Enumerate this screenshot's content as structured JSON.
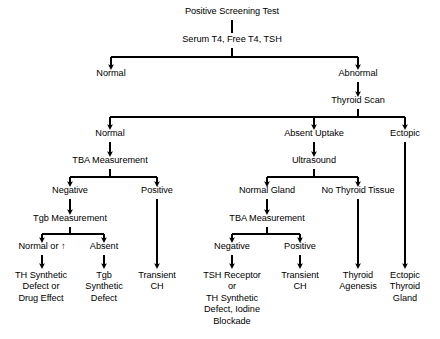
{
  "diagram": {
    "title": "Positive Screening Test",
    "style": {
      "stroke": "#000000",
      "text_color": "#000000",
      "background": "#ffffff"
    },
    "nodes": [
      {
        "id": "positive-screening-test",
        "label": "Positive Screening Test",
        "x": 232,
        "y": 12
      },
      {
        "id": "serum-t4-free-t4-tsh",
        "label": "Serum T4, Free T4, TSH",
        "x": 232,
        "y": 41
      },
      {
        "id": "normal-labs",
        "label": "Normal",
        "x": 111,
        "y": 74
      },
      {
        "id": "abnormal-labs",
        "label": "Abnormal",
        "x": 358,
        "y": 74
      },
      {
        "id": "thyroid-scan",
        "label": "Thyroid Scan",
        "x": 358,
        "y": 101
      },
      {
        "id": "scan-normal",
        "label": "Normal",
        "x": 110,
        "y": 134
      },
      {
        "id": "scan-absent-uptake",
        "label": "Absent Uptake",
        "x": 314,
        "y": 134
      },
      {
        "id": "scan-ectopic",
        "label": "Ectopic",
        "x": 405,
        "y": 134
      },
      {
        "id": "tba-measurement-left",
        "label": "TBA Measurement",
        "x": 110,
        "y": 161
      },
      {
        "id": "ultrasound",
        "label": "Ultrasound",
        "x": 314,
        "y": 161
      },
      {
        "id": "tba-negative-left",
        "label": "Negative",
        "x": 70,
        "y": 191
      },
      {
        "id": "tba-positive-left",
        "label": "Positive",
        "x": 157,
        "y": 191
      },
      {
        "id": "us-normal-gland",
        "label": "Normal Gland",
        "x": 267,
        "y": 191
      },
      {
        "id": "us-no-thyroid-tissue",
        "label": "No Thyroid Tissue",
        "x": 358,
        "y": 191
      },
      {
        "id": "tgb-measurement",
        "label": "Tgb Measurement",
        "x": 70,
        "y": 219
      },
      {
        "id": "tba-measurement-right",
        "label": "TBA Measurement",
        "x": 267,
        "y": 219
      },
      {
        "id": "tgb-normal-or-high",
        "label": "Normal or ↑",
        "x": 42,
        "y": 247
      },
      {
        "id": "tgb-absent",
        "label": "Absent",
        "x": 104,
        "y": 247
      },
      {
        "id": "tba-negative-right",
        "label": "Negative",
        "x": 232,
        "y": 247
      },
      {
        "id": "tba-positive-right",
        "label": "Positive",
        "x": 300,
        "y": 247
      },
      {
        "id": "th-synthetic-defect-or-drug-effect",
        "label": "TH Synthetic\nDefect or\nDrug Effect",
        "x": 41,
        "y": 276
      },
      {
        "id": "tgb-synthetic-defect",
        "label": "Tgb\nSynthetic\nDefect",
        "x": 104,
        "y": 276
      },
      {
        "id": "transient-ch-left",
        "label": "Transient\nCH",
        "x": 157,
        "y": 276
      },
      {
        "id": "tsh-receptor-or-th-synthetic-defect-iodine-blockade",
        "label": "TSH Receptor\nor\nTH Synthetic\nDefect, Iodine\nBlockade",
        "x": 232,
        "y": 276
      },
      {
        "id": "transient-ch-right",
        "label": "Transient\nCH",
        "x": 300,
        "y": 276
      },
      {
        "id": "thyroid-agenesis",
        "label": "Thyroid\nAgenesis",
        "x": 358,
        "y": 276
      },
      {
        "id": "ectopic-thyroid-gland",
        "label": "Ectopic\nThyroid\nGland",
        "x": 405,
        "y": 276
      }
    ],
    "edges": [
      {
        "from": "positive-screening-test",
        "to": "serum-t4-free-t4-tsh",
        "kind": "plain-line"
      },
      {
        "from": "serum-t4-free-t4-tsh",
        "to": "normal-labs",
        "kind": "branch-arrow"
      },
      {
        "from": "serum-t4-free-t4-tsh",
        "to": "abnormal-labs",
        "kind": "branch-arrow"
      },
      {
        "from": "abnormal-labs",
        "to": "thyroid-scan",
        "kind": "arrow"
      },
      {
        "from": "thyroid-scan",
        "to": "scan-normal",
        "kind": "branch-arrow"
      },
      {
        "from": "thyroid-scan",
        "to": "scan-absent-uptake",
        "kind": "branch-arrow"
      },
      {
        "from": "thyroid-scan",
        "to": "scan-ectopic",
        "kind": "branch-arrow"
      },
      {
        "from": "scan-normal",
        "to": "tba-measurement-left",
        "kind": "arrow"
      },
      {
        "from": "scan-absent-uptake",
        "to": "ultrasound",
        "kind": "arrow"
      },
      {
        "from": "tba-measurement-left",
        "to": "tba-negative-left",
        "kind": "branch-arrow"
      },
      {
        "from": "tba-measurement-left",
        "to": "tba-positive-left",
        "kind": "branch-arrow"
      },
      {
        "from": "ultrasound",
        "to": "us-normal-gland",
        "kind": "branch-arrow"
      },
      {
        "from": "ultrasound",
        "to": "us-no-thyroid-tissue",
        "kind": "branch-arrow"
      },
      {
        "from": "tba-negative-left",
        "to": "tgb-measurement",
        "kind": "arrow"
      },
      {
        "from": "us-normal-gland",
        "to": "tba-measurement-right",
        "kind": "arrow"
      },
      {
        "from": "tgb-measurement",
        "to": "tgb-normal-or-high",
        "kind": "branch-arrow"
      },
      {
        "from": "tgb-measurement",
        "to": "tgb-absent",
        "kind": "branch-arrow"
      },
      {
        "from": "tba-measurement-right",
        "to": "tba-negative-right",
        "kind": "branch-arrow"
      },
      {
        "from": "tba-measurement-right",
        "to": "tba-positive-right",
        "kind": "branch-arrow"
      },
      {
        "from": "tgb-normal-or-high",
        "to": "th-synthetic-defect-or-drug-effect",
        "kind": "arrow"
      },
      {
        "from": "tgb-absent",
        "to": "tgb-synthetic-defect",
        "kind": "arrow"
      },
      {
        "from": "tba-positive-left",
        "to": "transient-ch-left",
        "kind": "long-arrow"
      },
      {
        "from": "tba-negative-right",
        "to": "tsh-receptor-or-th-synthetic-defect-iodine-blockade",
        "kind": "arrow"
      },
      {
        "from": "tba-positive-right",
        "to": "transient-ch-right",
        "kind": "arrow"
      },
      {
        "from": "us-no-thyroid-tissue",
        "to": "thyroid-agenesis",
        "kind": "long-arrow"
      },
      {
        "from": "scan-ectopic",
        "to": "ectopic-thyroid-gland",
        "kind": "long-arrow"
      }
    ]
  }
}
